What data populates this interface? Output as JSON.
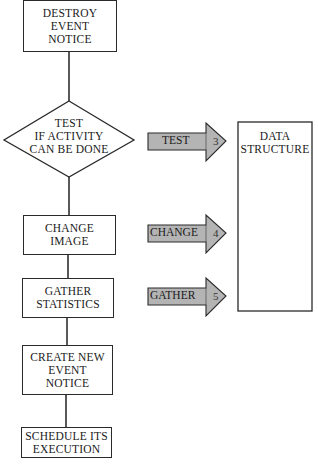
{
  "flowchart": {
    "steps": [
      {
        "id": "destroy",
        "lines": [
          "DESTROY",
          "EVENT",
          "NOTICE"
        ],
        "shape": "rectangle"
      },
      {
        "id": "test",
        "lines": [
          "TEST",
          "IF ACTIVITY",
          "CAN BE DONE"
        ],
        "shape": "diamond"
      },
      {
        "id": "change",
        "lines": [
          "CHANGE",
          "IMAGE"
        ],
        "shape": "rectangle"
      },
      {
        "id": "gather",
        "lines": [
          "GATHER",
          "STATISTICS"
        ],
        "shape": "rectangle"
      },
      {
        "id": "create",
        "lines": [
          "CREATE NEW",
          "EVENT",
          "NOTICE"
        ],
        "shape": "rectangle"
      },
      {
        "id": "schedule",
        "lines": [
          "SCHEDULE ITS",
          "EXECUTION"
        ],
        "shape": "rectangle"
      }
    ],
    "arrows": [
      {
        "label": "TEST",
        "number": "3"
      },
      {
        "label": "CHANGE",
        "number": "4"
      },
      {
        "label": "GATHER",
        "number": "5"
      }
    ],
    "data_structure": {
      "lines": [
        "DATA",
        "STRUCTURE"
      ]
    },
    "colors": {
      "arrow_fill": "#b4b4b4",
      "stroke": "#2a2a2a",
      "background": "#ffffff"
    }
  }
}
